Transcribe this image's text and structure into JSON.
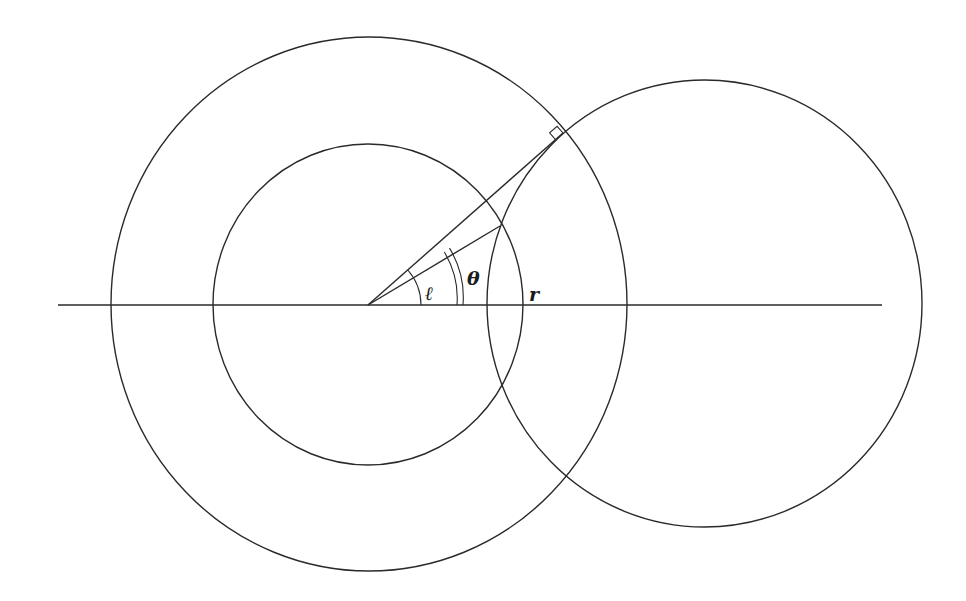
{
  "diagram": {
    "type": "geometric-construction",
    "labels": {
      "ell": "ℓ",
      "theta": "θ",
      "r": "r"
    },
    "colors": {
      "stroke": "#2a2a2a",
      "background": "#ffffff"
    },
    "elements": {
      "horizontal_axis": {
        "x1": 58,
        "y1": 305,
        "x2": 882,
        "y2": 305
      },
      "outer_circle": {
        "cx": 369,
        "cy": 304,
        "rx": 258,
        "ry": 267
      },
      "inner_circle": {
        "cx": 368,
        "cy": 304.5,
        "rx": 155,
        "ry": 160.5
      },
      "right_circle": {
        "cx": 704.5,
        "cy": 303.5,
        "rx": 217.5,
        "ry": 223.5
      },
      "tangent_line": {
        "from": [
          368,
          305
        ],
        "to": [
          563,
          133
        ]
      },
      "intersection_line": {
        "from": [
          368,
          305
        ],
        "to": [
          500,
          226
        ]
      },
      "right_angle_marker_at": [
        563,
        133
      ],
      "angle_ell_arc_radius": 53,
      "angle_theta_arc_radii": [
        89,
        95
      ]
    }
  }
}
